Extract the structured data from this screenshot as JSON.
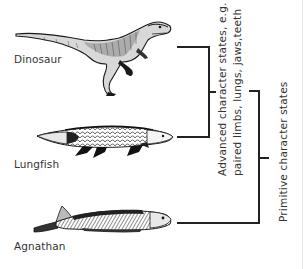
{
  "diagram": {
    "type": "cladogram",
    "taxa": [
      {
        "label": "Dinosaur",
        "icon": "dinosaur-illustration"
      },
      {
        "label": "Lungfish",
        "icon": "lungfish-illustration"
      },
      {
        "label": "Agnathan",
        "icon": "agnathan-illustration"
      }
    ],
    "nodes": {
      "advanced": {
        "line1": "Advanced character states, e.g.",
        "line2": "paired limbs, lungs, jaws,teeth"
      },
      "primitive": {
        "line1": "Primitive character states"
      }
    },
    "colors": {
      "line": "#222222",
      "text": "#333333",
      "background": "#ffffff"
    }
  }
}
